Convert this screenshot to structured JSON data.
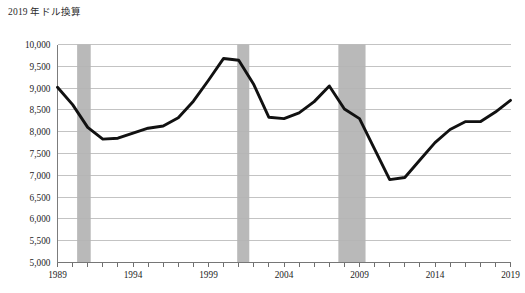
{
  "chart_data": {
    "type": "line",
    "title": "2019 年ドル換算",
    "xlabel": "",
    "ylabel": "",
    "xlim": [
      1989,
      2019
    ],
    "ylim": [
      5000,
      10000
    ],
    "grid": true,
    "legend": false,
    "y_ticks": [
      "10,000",
      "9,500",
      "9,000",
      "8,500",
      "8,000",
      "7,500",
      "7,000",
      "6,500",
      "6,000",
      "5,500",
      "5,000"
    ],
    "y_tick_values": [
      10000,
      9500,
      9000,
      8500,
      8000,
      7500,
      7000,
      6500,
      6000,
      5500,
      5000
    ],
    "x_ticks": [
      "1989",
      "1994",
      "1999",
      "2004",
      "2009",
      "2014",
      "2019"
    ],
    "x_tick_values": [
      1989,
      1994,
      1999,
      2004,
      2009,
      2014,
      2019
    ],
    "x": [
      1989,
      1990,
      1991,
      1992,
      1993,
      1994,
      1995,
      1996,
      1997,
      1998,
      1999,
      2000,
      2001,
      2002,
      2003,
      2004,
      2005,
      2006,
      2007,
      2008,
      2009,
      2010,
      2011,
      2012,
      2013,
      2014,
      2015,
      2016,
      2017,
      2018,
      2019
    ],
    "values": [
      9020,
      8620,
      8100,
      7830,
      7850,
      7970,
      8080,
      8130,
      8320,
      8700,
      9180,
      9680,
      9640,
      9080,
      8330,
      8300,
      8430,
      8690,
      9050,
      8520,
      8300,
      7600,
      6900,
      6950,
      7350,
      7750,
      8050,
      8230,
      8230,
      8450,
      8720
    ],
    "series": [
      {
        "name": "2019 年ドル換算",
        "color": "#111111",
        "values": [
          9020,
          8620,
          8100,
          7830,
          7850,
          7970,
          8080,
          8130,
          8320,
          8700,
          9180,
          9680,
          9640,
          9080,
          8330,
          8300,
          8430,
          8690,
          9050,
          8520,
          8300,
          7600,
          6900,
          6950,
          7350,
          7750,
          8050,
          8230,
          8230,
          8450,
          8720
        ]
      }
    ],
    "shaded_regions": [
      {
        "name": "recession-1990",
        "start": 1990.3,
        "end": 1991.2,
        "color": "#b9b9b9"
      },
      {
        "name": "recession-2001",
        "start": 2000.9,
        "end": 2001.7,
        "color": "#b9b9b9"
      },
      {
        "name": "recession-2008",
        "start": 2007.6,
        "end": 2009.4,
        "color": "#b9b9b9"
      }
    ],
    "annotations": []
  },
  "caption": ""
}
